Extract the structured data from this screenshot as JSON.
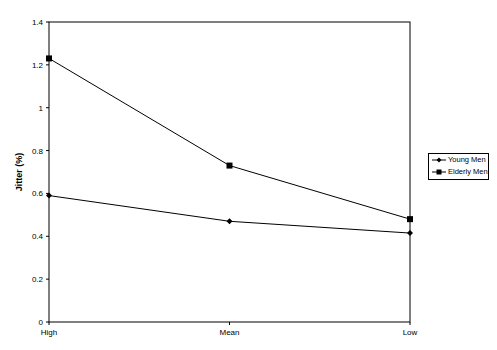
{
  "chart_data": {
    "type": "line",
    "title": "",
    "xlabel": "",
    "ylabel": "Jitter (%)",
    "categories": [
      "High",
      "Mean",
      "Low"
    ],
    "series": [
      {
        "name": "Young Men",
        "marker": "diamond",
        "values": [
          0.59,
          0.47,
          0.415
        ]
      },
      {
        "name": "Elderly Men",
        "marker": "square",
        "values": [
          1.23,
          0.73,
          0.48
        ]
      }
    ],
    "ylim": [
      0,
      1.4
    ],
    "yticks": [
      "0",
      "0.2",
      "0.4",
      "0.6",
      "0.8",
      "1",
      "1.2",
      "1.4"
    ],
    "grid": false,
    "legend_position": "right"
  },
  "legend": {
    "young": "Young Men",
    "elderly": "Elderly Men"
  },
  "colors": {
    "line": "#000000",
    "background": "#ffffff"
  }
}
